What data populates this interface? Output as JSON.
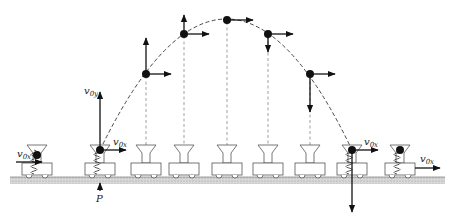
{
  "diagram": {
    "labels": {
      "v0x_left": "v",
      "v0x_left_sub": "0x",
      "v0y": "v",
      "v0y_sub": "0y",
      "v0x_launch": "v",
      "v0x_launch_sub": "0x",
      "v0x_catch": "v",
      "v0x_catch_sub": "0x",
      "v0x_right": "v",
      "v0x_right_sub": "0x",
      "point_P": "P"
    },
    "carts_x": [
      37,
      100,
      145,
      190,
      234,
      277,
      320,
      362,
      406
    ],
    "ball_positions": [
      {
        "x": 100,
        "y": 150,
        "vx": 26,
        "vy": -55
      },
      {
        "x": 146,
        "y": 74,
        "vx": 25,
        "vy": -35
      },
      {
        "x": 184,
        "y": 34,
        "vx": 25,
        "vy": -14
      },
      {
        "x": 227,
        "y": 20,
        "vx": 25,
        "vy": 0
      },
      {
        "x": 268,
        "y": 34,
        "vx": 25,
        "vy": 14
      },
      {
        "x": 310,
        "y": 74,
        "vx": 25,
        "vy": 36
      },
      {
        "x": 352,
        "y": 150,
        "vx": 26,
        "vy": 60
      }
    ],
    "colors": {
      "ink": "#111111",
      "ground": "#bbbbbb",
      "dashed": "#888888"
    }
  }
}
